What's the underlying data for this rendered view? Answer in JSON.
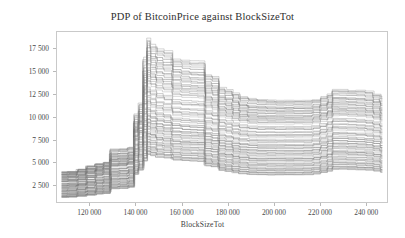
{
  "chart_data": {
    "type": "line",
    "title": "PDP of BitcoinPrice against BlockSizeTot",
    "subtitle": "",
    "xlabel": "BlockSizeTot",
    "ylabel": "BitcoinPrice",
    "xlim": [
      106000,
      249000
    ],
    "ylim": [
      700,
      19200
    ],
    "grid": false,
    "legend": null,
    "legend_position": "none",
    "line_color": "#7d7d7d",
    "xticks": [
      120000,
      140000,
      160000,
      180000,
      200000,
      220000,
      240000
    ],
    "xtick_labels": [
      "120 000",
      "140 000",
      "160 000",
      "180 000",
      "200 000",
      "220 000",
      "240 000"
    ],
    "yticks": [
      2500,
      5000,
      7500,
      10000,
      12500,
      15000,
      17500
    ],
    "ytick_labels": [
      "2 500",
      "5 000",
      "7 500",
      "10 000",
      "12 500",
      "15 000",
      "17 500"
    ],
    "x": [
      108000,
      112000,
      116000,
      120000,
      124000,
      127000,
      130000,
      134000,
      138000,
      140000,
      142000,
      144000,
      145500,
      147000,
      150000,
      153000,
      157000,
      161000,
      165000,
      168000,
      171000,
      174000,
      177000,
      180000,
      183000,
      186000,
      190000,
      194000,
      198000,
      202000,
      206000,
      210000,
      214000,
      218000,
      221000,
      224000,
      226000,
      229000,
      233000,
      237000,
      241000,
      244000,
      247000
    ],
    "series": [
      {
        "name": "ice-band-upper",
        "values": [
          4000,
          4050,
          4300,
          4650,
          4900,
          5050,
          6500,
          6550,
          6700,
          10300,
          11500,
          16500,
          18600,
          17900,
          17400,
          17200,
          16300,
          16200,
          16100,
          16100,
          14600,
          14400,
          13200,
          13000,
          12600,
          12200,
          12000,
          11900,
          11850,
          11800,
          11800,
          11800,
          11800,
          11900,
          12200,
          12500,
          13000,
          13000,
          12900,
          12900,
          12800,
          12500,
          12200
        ]
      },
      {
        "name": "ice-band-upper-mid",
        "values": [
          3700,
          3750,
          3950,
          4250,
          4500,
          4650,
          5700,
          5750,
          5900,
          9000,
          10000,
          14000,
          16200,
          15700,
          15300,
          15100,
          14400,
          14200,
          14100,
          14050,
          12900,
          12700,
          11700,
          11500,
          11200,
          10900,
          10700,
          10650,
          10600,
          10600,
          10600,
          10600,
          10600,
          10700,
          10950,
          11200,
          11600,
          11600,
          11550,
          11500,
          11400,
          11200,
          10900
        ]
      },
      {
        "name": "ice-band-mid-high",
        "values": [
          3300,
          3350,
          3500,
          3800,
          4050,
          4200,
          5100,
          5150,
          5300,
          8300,
          9200,
          12500,
          13900,
          13600,
          13200,
          13000,
          12500,
          12400,
          12350,
          12300,
          11200,
          11000,
          10200,
          10050,
          9800,
          9600,
          9450,
          9400,
          9400,
          9400,
          9400,
          9400,
          9400,
          9500,
          9700,
          9950,
          10300,
          10300,
          10250,
          10200,
          10100,
          9900,
          9650
        ]
      },
      {
        "name": "ice-band-center",
        "values": [
          2900,
          2950,
          3100,
          3350,
          3600,
          3700,
          4600,
          4650,
          4800,
          7400,
          8200,
          10200,
          11500,
          11200,
          10900,
          10700,
          10300,
          10200,
          10150,
          10100,
          9300,
          9150,
          8500,
          8350,
          8150,
          8000,
          7900,
          7850,
          7850,
          7850,
          7850,
          7850,
          7850,
          7950,
          8150,
          8350,
          8700,
          8700,
          8650,
          8600,
          8500,
          8350,
          8150
        ]
      },
      {
        "name": "ice-band-mid-low",
        "values": [
          2400,
          2450,
          2600,
          2800,
          3000,
          3100,
          3900,
          3950,
          4100,
          6200,
          6900,
          8600,
          9700,
          9500,
          9200,
          9050,
          8700,
          8600,
          8550,
          8500,
          7800,
          7650,
          7100,
          6980,
          6800,
          6680,
          6600,
          6560,
          6550,
          6550,
          6550,
          6550,
          6560,
          6650,
          6850,
          7050,
          7350,
          7350,
          7300,
          7250,
          7180,
          7050,
          6850
        ]
      },
      {
        "name": "ice-band-low",
        "values": [
          1900,
          1950,
          2080,
          2250,
          2420,
          2500,
          3200,
          3250,
          3400,
          5200,
          5800,
          7200,
          8100,
          7950,
          7700,
          7580,
          7280,
          7200,
          7160,
          7120,
          6500,
          6380,
          5900,
          5800,
          5620,
          5500,
          5400,
          5370,
          5360,
          5360,
          5360,
          5360,
          5380,
          5470,
          5650,
          5830,
          6100,
          6100,
          6060,
          6020,
          5960,
          5850,
          5680
        ]
      },
      {
        "name": "ice-band-lower",
        "values": [
          1500,
          1540,
          1650,
          1790,
          1940,
          2010,
          2600,
          2650,
          2780,
          4350,
          4850,
          6050,
          6850,
          6700,
          6500,
          6400,
          6150,
          6080,
          6040,
          6000,
          5450,
          5340,
          4900,
          4800,
          4640,
          4520,
          4420,
          4390,
          4380,
          4380,
          4380,
          4380,
          4400,
          4480,
          4650,
          4820,
          5050,
          5050,
          5020,
          4980,
          4930,
          4830,
          4680
        ]
      },
      {
        "name": "ice-band-bottom",
        "values": [
          1200,
          1230,
          1320,
          1440,
          1570,
          1630,
          2150,
          2190,
          2310,
          3700,
          4150,
          5150,
          5850,
          5720,
          5550,
          5460,
          5240,
          5180,
          5140,
          5110,
          4620,
          4520,
          4120,
          4030,
          3880,
          3770,
          3680,
          3650,
          3640,
          3640,
          3640,
          3640,
          3660,
          3730,
          3890,
          4040,
          4250,
          4250,
          4220,
          4190,
          4150,
          4060,
          3920
        ]
      }
    ]
  }
}
